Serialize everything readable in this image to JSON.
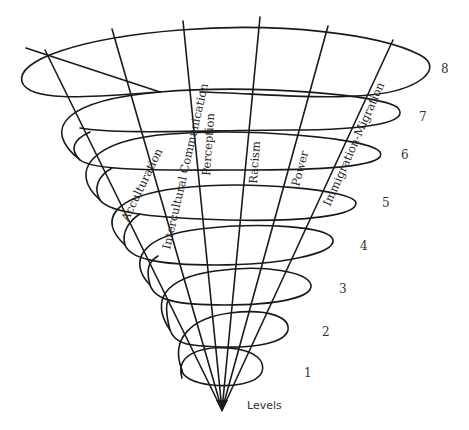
{
  "diagram": {
    "type": "spiral-cone",
    "apex_label": "Levels",
    "axes": [
      {
        "label": "Acculturation"
      },
      {
        "label": "Intercultural Communication"
      },
      {
        "label": "Perception"
      },
      {
        "label": "Racism"
      },
      {
        "label": "Power"
      },
      {
        "label": "Immigration-Migration"
      }
    ],
    "levels": [
      "1",
      "2",
      "3",
      "4",
      "5",
      "6",
      "7",
      "8"
    ],
    "colors": {
      "line": "#1a1a1a",
      "text": "#2a2a2a",
      "background": "#ffffff"
    }
  }
}
